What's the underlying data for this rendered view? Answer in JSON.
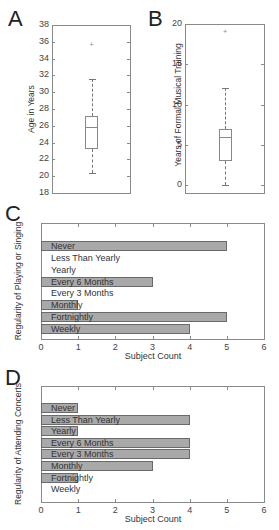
{
  "chart_data": [
    {
      "panel": "A",
      "type": "box",
      "title": "",
      "xlabel": "",
      "ylabel": "Age in Years",
      "ylim": [
        18,
        38
      ],
      "yticks": [
        "38",
        "36",
        "34",
        "32",
        "30",
        "28",
        "26",
        "24",
        "22",
        "20",
        "18"
      ],
      "stats": {
        "whisker_high": 31.6,
        "q3": 27.2,
        "median": 25.9,
        "q1": 23.2,
        "whisker_low": 20.4,
        "outliers": [
          35.6
        ]
      }
    },
    {
      "panel": "B",
      "type": "box",
      "title": "",
      "xlabel": "",
      "ylabel": "Years of Formal Musical Training",
      "ylim": [
        0,
        20
      ],
      "yticks": [
        "20",
        "15",
        "10",
        "5",
        "0"
      ],
      "stats": {
        "whisker_high": 12,
        "q3": 7,
        "median": 6,
        "q1": 3,
        "whisker_low": 0,
        "outliers": [
          19
        ]
      }
    },
    {
      "panel": "C",
      "type": "bar",
      "orientation": "horizontal",
      "xlabel": "Subject Count",
      "ylabel": "Regularity of Playing or Singing",
      "xlim": [
        0,
        6
      ],
      "xticks": [
        "0",
        "1",
        "2",
        "3",
        "4",
        "5",
        "6"
      ],
      "categories": [
        "Never",
        "Less Than Yearly",
        "Yearly",
        "Every 6 Months",
        "Every 3 Months",
        "Monthly",
        "Fortnightly",
        "Weekly"
      ],
      "values": [
        5,
        0,
        0,
        3,
        0,
        1,
        5,
        4
      ]
    },
    {
      "panel": "D",
      "type": "bar",
      "orientation": "horizontal",
      "xlabel": "Subject Count",
      "ylabel": "Regularity of Attending Concerts",
      "xlim": [
        0,
        6
      ],
      "xticks": [
        "0",
        "1",
        "2",
        "3",
        "4",
        "5",
        "6"
      ],
      "categories": [
        "Never",
        "Less Than Yearly",
        "Yearly",
        "Every 6 Months",
        "Every 3 Months",
        "Monthly",
        "Fortnightly",
        "Weekly"
      ],
      "values": [
        1,
        4,
        1,
        4,
        4,
        3,
        1,
        0
      ]
    }
  ],
  "panels": {
    "a": {
      "letter": "A"
    },
    "b": {
      "letter": "B"
    },
    "c": {
      "letter": "C"
    },
    "d": {
      "letter": "D"
    }
  },
  "colors": {
    "bar_fill": "#a9a9a9",
    "bar_edge": "#6a6a6a",
    "axis": "#8a8a8a"
  },
  "outlier_marker": "+"
}
